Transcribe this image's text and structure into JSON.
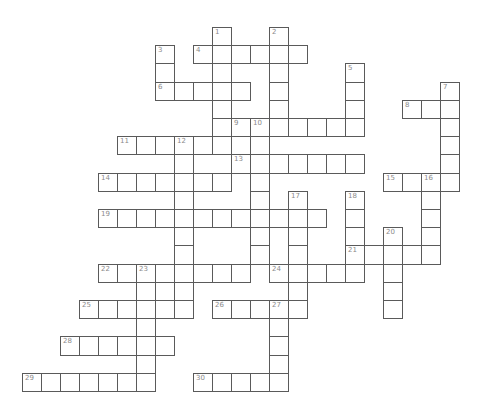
{
  "puzzle": {
    "type": "crossword",
    "grid_origin": {
      "x": 21.5,
      "y": 27
    },
    "cell_size": {
      "w": 19,
      "h": 18.2
    },
    "colors": {
      "line": "#5a5a5a",
      "number": "#8a8a8a",
      "cell": "#ffffff",
      "background": "#ffffff"
    },
    "entries": [
      {
        "number": "1",
        "direction": "down",
        "col": 10,
        "row": 0,
        "length": 6
      },
      {
        "number": "2",
        "direction": "down",
        "col": 13,
        "row": 0,
        "length": 6
      },
      {
        "number": "3",
        "direction": "down",
        "col": 7,
        "row": 1,
        "length": 3
      },
      {
        "number": "4",
        "direction": "across",
        "col": 9,
        "row": 1,
        "length": 6
      },
      {
        "number": "5",
        "direction": "down",
        "col": 17,
        "row": 2,
        "length": 4
      },
      {
        "number": "6",
        "direction": "across",
        "col": 7,
        "row": 3,
        "length": 5
      },
      {
        "number": "7",
        "direction": "down",
        "col": 22,
        "row": 3,
        "length": 6
      },
      {
        "number": "8",
        "direction": "across",
        "col": 20,
        "row": 4,
        "length": 3
      },
      {
        "number": "9",
        "direction": "across",
        "col": 11,
        "row": 5,
        "length": 7
      },
      {
        "number": "9",
        "direction": "down",
        "col": 11,
        "row": 5,
        "length": 3
      },
      {
        "number": "10",
        "direction": "down",
        "col": 12,
        "row": 5,
        "length": 8
      },
      {
        "number": "11",
        "direction": "across",
        "col": 5,
        "row": 6,
        "length": 7
      },
      {
        "number": "12",
        "direction": "down",
        "col": 8,
        "row": 6,
        "length": 10
      },
      {
        "number": "13",
        "direction": "across",
        "col": 11,
        "row": 7,
        "length": 7
      },
      {
        "number": "14",
        "direction": "across",
        "col": 4,
        "row": 8,
        "length": 7
      },
      {
        "number": "15",
        "direction": "across",
        "col": 19,
        "row": 8,
        "length": 4
      },
      {
        "number": "16",
        "direction": "down",
        "col": 21,
        "row": 8,
        "length": 5
      },
      {
        "number": "17",
        "direction": "down",
        "col": 14,
        "row": 9,
        "length": 7
      },
      {
        "number": "18",
        "direction": "down",
        "col": 17,
        "row": 9,
        "length": 5
      },
      {
        "number": "19",
        "direction": "across",
        "col": 4,
        "row": 10,
        "length": 12
      },
      {
        "number": "20",
        "direction": "down",
        "col": 19,
        "row": 11,
        "length": 5
      },
      {
        "number": "21",
        "direction": "across",
        "col": 17,
        "row": 12,
        "length": 5
      },
      {
        "number": "22",
        "direction": "across",
        "col": 4,
        "row": 13,
        "length": 8
      },
      {
        "number": "23",
        "direction": "down",
        "col": 6,
        "row": 13,
        "length": 7
      },
      {
        "number": "24",
        "direction": "across",
        "col": 13,
        "row": 13,
        "length": 5
      },
      {
        "number": "25",
        "direction": "across",
        "col": 3,
        "row": 15,
        "length": 6
      },
      {
        "number": "26",
        "direction": "across",
        "col": 10,
        "row": 15,
        "length": 5
      },
      {
        "number": "27",
        "direction": "down",
        "col": 13,
        "row": 15,
        "length": 5
      },
      {
        "number": "28",
        "direction": "across",
        "col": 2,
        "row": 17,
        "length": 6
      },
      {
        "number": "29",
        "direction": "across",
        "col": 0,
        "row": 19,
        "length": 7
      },
      {
        "number": "30",
        "direction": "across",
        "col": 9,
        "row": 19,
        "length": 5
      }
    ]
  }
}
